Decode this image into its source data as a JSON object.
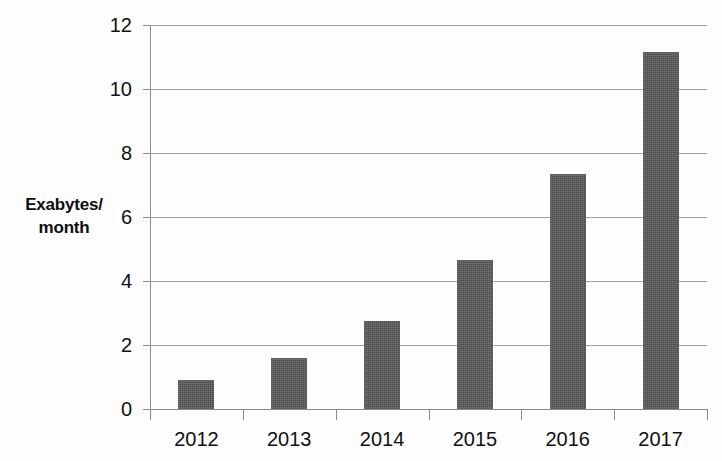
{
  "chart_data": {
    "type": "bar",
    "title": "",
    "subtitle": "",
    "xlabel": "",
    "ylabel": "Exabytes/\nmonth",
    "ylabel_lines": [
      "Exabytes/",
      "month"
    ],
    "categories": [
      "2012",
      "2013",
      "2014",
      "2015",
      "2016",
      "2017"
    ],
    "values": [
      0.9,
      1.6,
      2.75,
      4.65,
      7.35,
      11.15
    ],
    "series": [
      {
        "name": "Global mobile data traffic",
        "values": [
          0.9,
          1.6,
          2.75,
          4.65,
          7.35,
          11.15
        ]
      }
    ],
    "ylim": [
      0,
      12
    ],
    "y_ticks": [
      0,
      2,
      4,
      6,
      8,
      10,
      12
    ],
    "y_tick_labels": [
      "0",
      "2",
      "4",
      "6",
      "8",
      "10",
      "12"
    ],
    "grid": true,
    "grid_axis": "y",
    "legend": false,
    "legend_position": "none",
    "bar_color": "#4b4b4b",
    "gridline_color": "#9f9f9f",
    "axis_color": "#8a8a8a",
    "background_color": "#fdfdfd",
    "text_color": "#101010"
  }
}
